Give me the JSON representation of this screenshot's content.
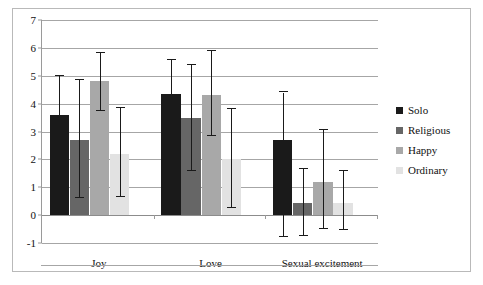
{
  "chart_data": {
    "type": "bar",
    "title": "",
    "subtitle": "",
    "xlabel": "",
    "ylabel": "",
    "categories": [
      "Joy",
      "Love",
      "Sexual excitement"
    ],
    "ylim": [
      -1,
      7
    ],
    "yticks": [
      -1,
      0,
      1,
      2,
      3,
      4,
      5,
      6,
      7
    ],
    "ytick_labels": [
      "-1",
      "0",
      "1",
      "2",
      "3",
      "4",
      "5",
      "6",
      "7"
    ],
    "grid": true,
    "grid_axis": "y",
    "legend_position": "right",
    "error_bars": true,
    "series": [
      {
        "name": "Solo",
        "color": "#1a1a1a",
        "values": [
          3.6,
          4.35,
          2.7
        ],
        "err_low": [
          2.2,
          3.1,
          0.0
        ],
        "err_high": [
          5.0,
          5.55,
          4.4
        ],
        "err_low_labels": [
          "2.2",
          "3.1",
          "-0.8"
        ],
        "err_high_labels": [
          "5.0",
          "5.55",
          "4.4"
        ]
      },
      {
        "name": "Religious",
        "color": "#666666",
        "values": [
          2.7,
          3.5,
          0.42
        ],
        "err_low": [
          0.6,
          1.6,
          0.0
        ],
        "err_high": [
          4.85,
          5.4,
          1.65
        ],
        "err_low_labels": [
          "0.6",
          "1.6",
          "-0.75"
        ],
        "err_high_labels": [
          "4.85",
          "5.4",
          "1.65"
        ]
      },
      {
        "name": "Happy",
        "color": "#a8a8a8",
        "values": [
          4.8,
          4.3,
          1.2
        ],
        "err_low": [
          3.75,
          2.85,
          0.0
        ],
        "err_high": [
          5.8,
          5.9,
          3.05
        ],
        "err_low_labels": [
          "3.75",
          "2.85",
          "-0.5"
        ],
        "err_high_labels": [
          "5.8",
          "5.9",
          "3.05"
        ]
      },
      {
        "name": "Ordinary",
        "color": "#e2e2e2",
        "values": [
          2.2,
          2.0,
          0.45
        ],
        "err_low": [
          0.65,
          0.25,
          0.0
        ],
        "err_high": [
          3.85,
          3.8,
          1.6
        ],
        "err_low_labels": [
          "0.65",
          "0.25",
          "-0.55"
        ],
        "err_high_labels": [
          "3.85",
          "3.8",
          "1.6"
        ]
      }
    ]
  },
  "legend": {
    "items": [
      {
        "label": "Solo",
        "color": "#1a1a1a"
      },
      {
        "label": "Religious",
        "color": "#666666"
      },
      {
        "label": "Happy",
        "color": "#a8a8a8"
      },
      {
        "label": "Ordinary",
        "color": "#e2e2e2"
      }
    ]
  }
}
